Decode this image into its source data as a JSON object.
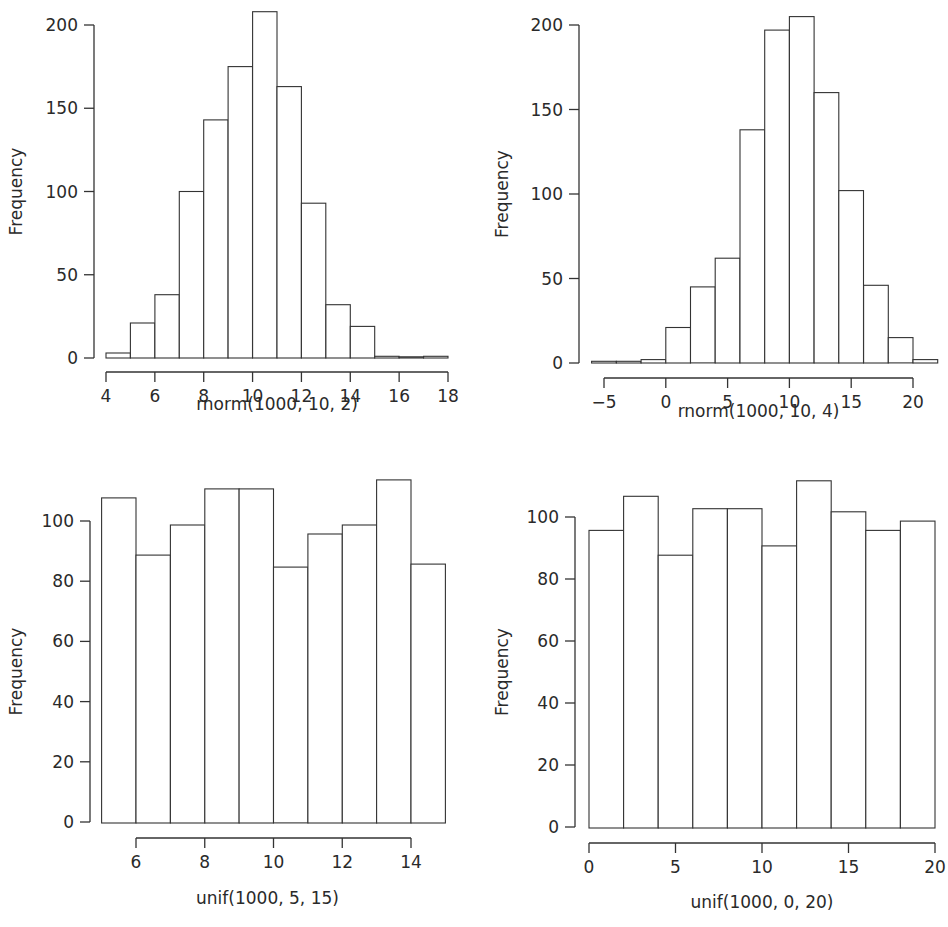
{
  "chart_data": [
    {
      "type": "bar",
      "subtype": "histogram",
      "title": "",
      "xlabel": "rnorm(1000, 10, 2)",
      "ylabel": "Frequency",
      "bin_edges": [
        4,
        5,
        6,
        7,
        8,
        9,
        10,
        11,
        12,
        13,
        14,
        15,
        16,
        17,
        18
      ],
      "values": [
        3,
        21,
        38,
        100,
        143,
        175,
        208,
        163,
        93,
        32,
        19,
        1,
        0,
        1
      ],
      "xticks": [
        4,
        6,
        8,
        10,
        12,
        14,
        16,
        18
      ],
      "yticks": [
        0,
        50,
        100,
        150,
        200
      ],
      "xlim": [
        4,
        18
      ],
      "ylim": [
        0,
        210
      ],
      "grid": false,
      "layout": {
        "yaxis_x": 94,
        "ytick_top_y": 25,
        "ytick_top_val": 200,
        "y0_px": 358,
        "xaxis_y": 372,
        "x_min_px": 106,
        "x_min_val": 4,
        "x_max_px": 448,
        "x_max_val": 18,
        "xaxis_start": 4,
        "xaxis_end": 18,
        "bar_base_y": 358,
        "xlabel_y": 410,
        "ylabel_x": 22
      }
    },
    {
      "type": "bar",
      "subtype": "histogram",
      "title": "",
      "xlabel": "rnorm(1000, 10, 4)",
      "ylabel": "Frequency",
      "bin_edges": [
        -6,
        -4,
        -2,
        0,
        2,
        4,
        6,
        8,
        10,
        12,
        14,
        16,
        18,
        20,
        22
      ],
      "values": [
        1,
        1,
        2,
        21,
        45,
        62,
        138,
        197,
        205,
        160,
        102,
        46,
        15,
        2
      ],
      "xticks": [
        -5,
        0,
        5,
        10,
        15,
        20
      ],
      "yticks": [
        0,
        50,
        100,
        150,
        200
      ],
      "xlim": [
        -6,
        22
      ],
      "ylim": [
        0,
        210
      ],
      "grid": false,
      "layout": {
        "yaxis_x": 579,
        "ytick_top_y": 25,
        "ytick_top_val": 200,
        "y0_px": 363,
        "xaxis_y": 378,
        "x_min_px": 604,
        "x_min_val": -5,
        "x_max_px": 913,
        "x_max_val": 20,
        "xaxis_start": -5,
        "xaxis_end": 20,
        "bar_base_y": 363,
        "xlabel_y": 417,
        "ylabel_x": 508
      }
    },
    {
      "type": "bar",
      "subtype": "histogram",
      "title": "",
      "xlabel": "unif(1000, 5, 15)",
      "ylabel": "Frequency",
      "bin_edges": [
        5,
        6,
        7,
        8,
        9,
        10,
        11,
        12,
        13,
        14,
        15
      ],
      "values": [
        108,
        89,
        99,
        111,
        111,
        85,
        96,
        99,
        114,
        86
      ],
      "xticks": [
        6,
        8,
        10,
        12,
        14
      ],
      "yticks": [
        0,
        20,
        40,
        60,
        80,
        100
      ],
      "xlim": [
        5,
        15
      ],
      "ylim": [
        0,
        115
      ],
      "grid": false,
      "layout": {
        "yaxis_x": 90,
        "ytick_top_y": 521,
        "ytick_top_val": 100,
        "y0_px": 822,
        "xaxis_y": 838,
        "x_min_px": 136,
        "x_min_val": 6,
        "x_max_px": 411,
        "x_max_val": 14,
        "xaxis_start": 6,
        "xaxis_end": 14,
        "bar_base_y": 823,
        "xlabel_y": 904,
        "ylabel_x": 22
      }
    },
    {
      "type": "bar",
      "subtype": "histogram",
      "title": "",
      "xlabel": "unif(1000, 0, 20)",
      "ylabel": "Frequency",
      "bin_edges": [
        0,
        2,
        4,
        6,
        8,
        10,
        12,
        14,
        16,
        18,
        20
      ],
      "values": [
        96,
        107,
        88,
        103,
        103,
        91,
        112,
        102,
        96,
        99
      ],
      "xticks": [
        0,
        5,
        10,
        15,
        20
      ],
      "yticks": [
        0,
        20,
        40,
        60,
        80,
        100
      ],
      "xlim": [
        0,
        20
      ],
      "ylim": [
        0,
        115
      ],
      "grid": false,
      "layout": {
        "yaxis_x": 575,
        "ytick_top_y": 517,
        "ytick_top_val": 100,
        "y0_px": 827,
        "xaxis_y": 843,
        "x_min_px": 589,
        "x_min_val": 0,
        "x_max_px": 935,
        "x_max_val": 20,
        "xaxis_start": 0,
        "xaxis_end": 20,
        "bar_base_y": 828,
        "xlabel_y": 908,
        "ylabel_x": 508
      }
    }
  ]
}
